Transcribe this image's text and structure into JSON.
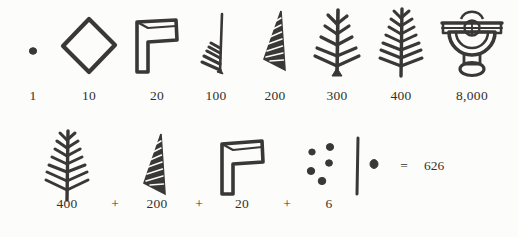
{
  "figure": {
    "kind": "numeral-system-chart",
    "ink_color": "#3a3836",
    "paper_color": "#fcfcfa"
  },
  "legend_row": {
    "name": "numeral-key-row",
    "entries": [
      {
        "value_label": "1",
        "glyph": "dot-glyph",
        "glyph_desc": "single filled dot"
      },
      {
        "value_label": "10",
        "glyph": "diamond-glyph",
        "glyph_desc": "open rhombus outline"
      },
      {
        "value_label": "20",
        "glyph": "flag-glyph",
        "glyph_desc": "outlined flag / P shape"
      },
      {
        "value_label": "100",
        "glyph": "frond-1-glyph",
        "glyph_desc": "vertical stroke with short left barbs"
      },
      {
        "value_label": "200",
        "glyph": "frond-2-glyph",
        "glyph_desc": "tapered leaf with hatched barbs"
      },
      {
        "value_label": "300",
        "glyph": "frond-3-glyph",
        "glyph_desc": "double sided feather, sparse"
      },
      {
        "value_label": "400",
        "glyph": "frond-4-glyph",
        "glyph_desc": "double sided feather, dense"
      },
      {
        "value_label": "8,000",
        "glyph": "chalice-glyph",
        "glyph_desc": "goblet with concentric arcs and crossbar"
      }
    ]
  },
  "example_row": {
    "name": "worked-example-row",
    "terms": [
      {
        "value_label": "400",
        "glyph": "frond-4-glyph"
      },
      {
        "value_label": "200",
        "glyph": "frond-2-glyph"
      },
      {
        "value_label": "20",
        "glyph": "flag-glyph"
      },
      {
        "value_label": "6",
        "glyph": "six-dots-glyph"
      }
    ],
    "operators": [
      "+",
      "+",
      "+"
    ],
    "equals_sign": "=",
    "total": "626"
  }
}
